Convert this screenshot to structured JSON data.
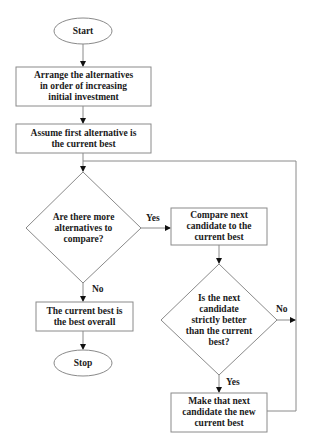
{
  "flowchart": {
    "nodes": {
      "start": {
        "type": "terminal",
        "label": "Start"
      },
      "arrange": {
        "type": "process",
        "label": "Arrange the alternatives\nin order of increasing\ninitial investment"
      },
      "assume": {
        "type": "process",
        "label": "Assume first alternative is\nthe current best"
      },
      "more": {
        "type": "decision",
        "label": "Are there more\nalternatives to\ncompare?"
      },
      "compare": {
        "type": "process",
        "label": "Compare next\ncandidate to the\ncurrent best"
      },
      "better": {
        "type": "decision",
        "label": "Is the next\ncandidate\nstrictly better\nthan the current\nbest?"
      },
      "make": {
        "type": "process",
        "label": "Make that next\ncandidate the new\ncurrent best"
      },
      "best": {
        "type": "process",
        "label": "The current best is\nthe best overall"
      },
      "stop": {
        "type": "terminal",
        "label": "Stop"
      }
    },
    "edges": {
      "more_yes": "Yes",
      "more_no": "No",
      "better_no": "No",
      "better_yes": "Yes"
    },
    "colors": {
      "stroke": "#8a8a8a",
      "arrow": "#111111",
      "text": "#1a1a1a",
      "background": "#ffffff"
    }
  }
}
